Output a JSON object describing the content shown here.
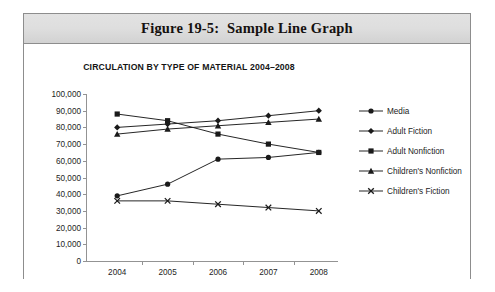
{
  "figure": {
    "title": "Figure 19-5:  Sample Line Graph",
    "border_color": "#8d8d8d",
    "band_color": "#dedede"
  },
  "chart_data": {
    "type": "line",
    "title": "CIRCULATION BY TYPE OF MATERIAL 2004–2008",
    "xlabel": "",
    "ylabel": "",
    "categories": [
      "2004",
      "2005",
      "2006",
      "2007",
      "2008"
    ],
    "ylim": [
      0,
      100000
    ],
    "ytick_labels": [
      "0",
      "10,000",
      "20,000",
      "30,000",
      "40,000",
      "50,000",
      "60,000",
      "70,000",
      "80,000",
      "90,000",
      "100,000"
    ],
    "ytick_values": [
      0,
      10000,
      20000,
      30000,
      40000,
      50000,
      60000,
      70000,
      80000,
      90000,
      100000
    ],
    "grid": false,
    "legend_position": "right",
    "line_color": "#1a1a1a",
    "series": [
      {
        "name": "Media",
        "marker": "circle",
        "values": [
          39000,
          46000,
          61000,
          62000,
          65000
        ]
      },
      {
        "name": "Adult Fiction",
        "marker": "diamond",
        "values": [
          80000,
          82000,
          84000,
          87000,
          90000
        ]
      },
      {
        "name": "Adult Nonfiction",
        "marker": "square",
        "values": [
          88000,
          84000,
          76000,
          70000,
          65000
        ]
      },
      {
        "name": "Children's Nonfiction",
        "marker": "triangle",
        "values": [
          76000,
          79000,
          81000,
          83000,
          85000
        ]
      },
      {
        "name": "Children's Fiction",
        "marker": "x",
        "values": [
          36000,
          36000,
          34000,
          32000,
          30000
        ]
      }
    ]
  }
}
